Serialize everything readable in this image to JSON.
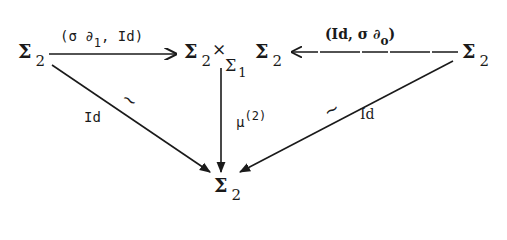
{
  "nodes": {
    "left": {
      "symbol": "Σ",
      "sub": "2"
    },
    "center_left": {
      "symbol": "Σ",
      "sub": "2"
    },
    "center_times": "×",
    "center_base": {
      "symbol": "Σ",
      "sub": "1"
    },
    "center_right": {
      "symbol": "Σ",
      "sub": "2"
    },
    "right": {
      "symbol": "Σ",
      "sub": "2"
    },
    "bottom": {
      "symbol": "Σ",
      "sub": "2"
    }
  },
  "arrows": {
    "top_left": {
      "label_pre": "(σ ∂",
      "label_sub": "1",
      "label_post": ", Id)"
    },
    "top_right": {
      "label_pre": "(Id, σ ∂",
      "label_sub": "o",
      "label_post": ")"
    },
    "vertical": {
      "label": "μ",
      "label_sup": "(2)"
    },
    "diag_left": {
      "label": "Id",
      "mark": "~"
    },
    "diag_right": {
      "label": "Id",
      "mark": "~"
    }
  },
  "colors": {
    "ink": "#1a1a1a",
    "background": "#ffffff"
  }
}
